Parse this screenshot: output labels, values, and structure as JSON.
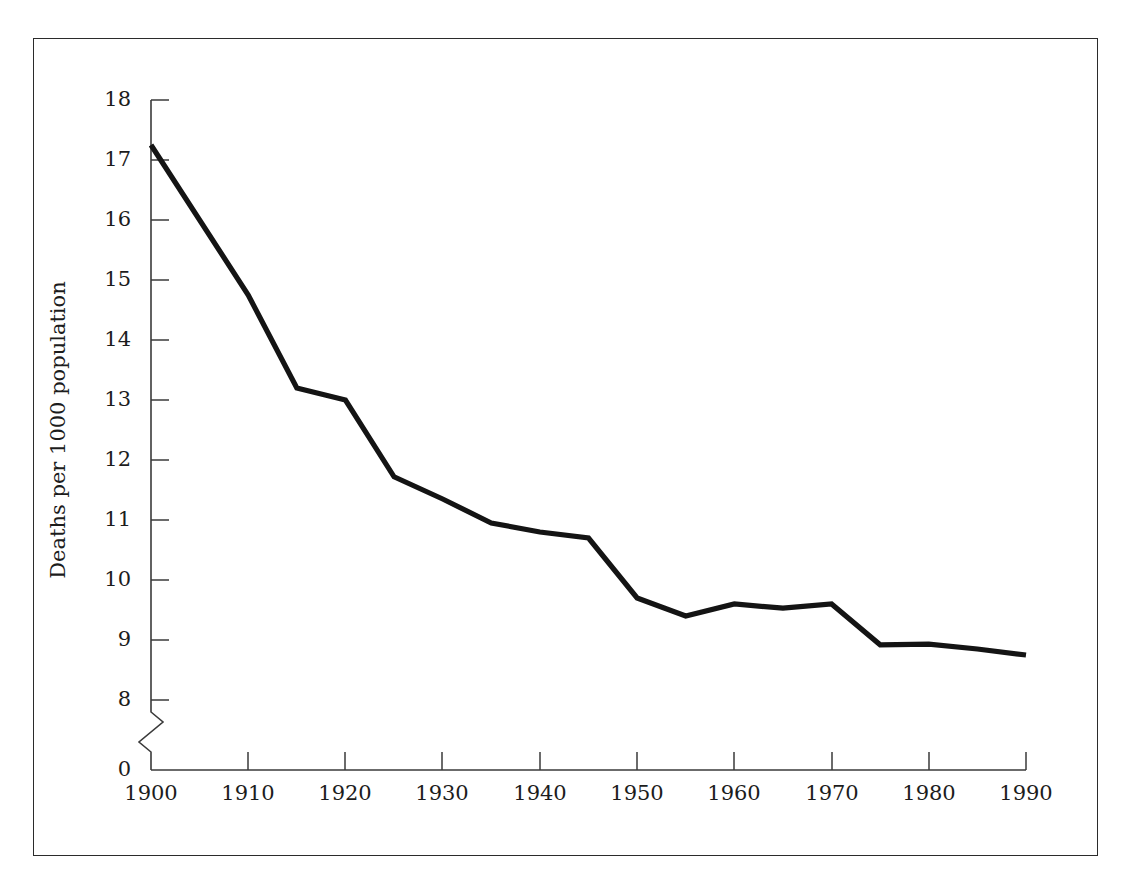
{
  "figure": {
    "frame_color": "#2b2b2b",
    "background": "#ffffff",
    "line_color": "#141414",
    "axis_color": "#3a3a3a",
    "text_color": "#1c1c1c"
  },
  "axes": {
    "ylabel": "Deaths per 1000 population",
    "xlabel": "",
    "y_ticks": [
      "18",
      "17",
      "16",
      "15",
      "14",
      "13",
      "12",
      "11",
      "10",
      "9",
      "8",
      "0"
    ],
    "x_ticks": [
      "1900",
      "1910",
      "1920",
      "1930",
      "1940",
      "1950",
      "1960",
      "1970",
      "1980",
      "1990"
    ],
    "y_axis_break": "zigzag-between-8-and-0"
  },
  "chart_data": {
    "type": "line",
    "title": "",
    "xlabel": "",
    "ylabel": "Deaths per 1000 population",
    "xlim": [
      1900,
      1990
    ],
    "ylim": [
      8,
      18
    ],
    "y_axis_break": true,
    "y_axis_break_range": [
      0,
      8
    ],
    "grid": false,
    "legend": false,
    "x": [
      1900,
      1910,
      1915,
      1920,
      1925,
      1930,
      1935,
      1940,
      1945,
      1950,
      1955,
      1960,
      1965,
      1970,
      1975,
      1980,
      1985,
      1990
    ],
    "values": [
      17.25,
      14.75,
      13.2,
      13.0,
      11.72,
      11.35,
      10.95,
      10.8,
      10.7,
      9.7,
      9.4,
      9.6,
      9.53,
      9.6,
      8.92,
      8.93,
      8.85,
      8.75
    ],
    "series": [
      {
        "name": "Death rate",
        "x": [
          1900,
          1910,
          1915,
          1920,
          1925,
          1930,
          1935,
          1940,
          1945,
          1950,
          1955,
          1960,
          1965,
          1970,
          1975,
          1980,
          1985,
          1990
        ],
        "values": [
          17.25,
          14.75,
          13.2,
          13.0,
          11.72,
          11.35,
          10.95,
          10.8,
          10.7,
          9.7,
          9.4,
          9.6,
          9.53,
          9.6,
          8.92,
          8.93,
          8.85,
          8.75
        ]
      }
    ],
    "x_tick_values": [
      1900,
      1910,
      1920,
      1930,
      1940,
      1950,
      1960,
      1970,
      1980,
      1990
    ],
    "y_tick_values": [
      18,
      17,
      16,
      15,
      14,
      13,
      12,
      11,
      10,
      9,
      8,
      0
    ],
    "annotations": []
  }
}
